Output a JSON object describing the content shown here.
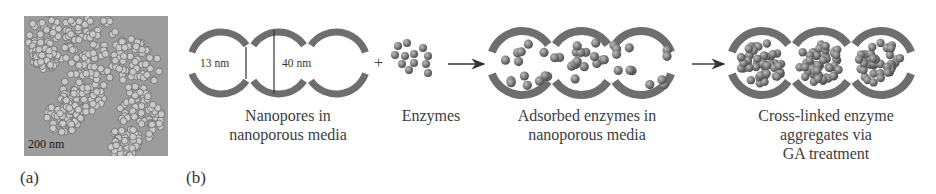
{
  "panel_a": {
    "label": "(a)",
    "image": "TEM micrograph of nanoporous silica particles",
    "scale_bar": "200 nm"
  },
  "panel_b": {
    "label": "(b)",
    "steps": [
      {
        "id": "nanopores",
        "caption_lines": [
          "Nanopores in",
          "nanoporous media"
        ],
        "dimensions": {
          "neck": "13 nm",
          "pore": "40 nm"
        }
      },
      {
        "id": "enzymes",
        "caption_lines": [
          "Enzymes"
        ]
      },
      {
        "id": "adsorbed",
        "caption_lines": [
          "Adsorbed enzymes in",
          "nanoporous media"
        ]
      },
      {
        "id": "crosslinked",
        "caption_lines": [
          "Cross-linked enzyme",
          "aggregates via",
          "GA treatment"
        ]
      }
    ],
    "operators": {
      "plus": "+"
    }
  },
  "colors": {
    "wall": "#6e6e6e",
    "enzyme": "#7a7a7a",
    "text": "#3c3c3c",
    "tem_bg": "#9a9a9a"
  }
}
